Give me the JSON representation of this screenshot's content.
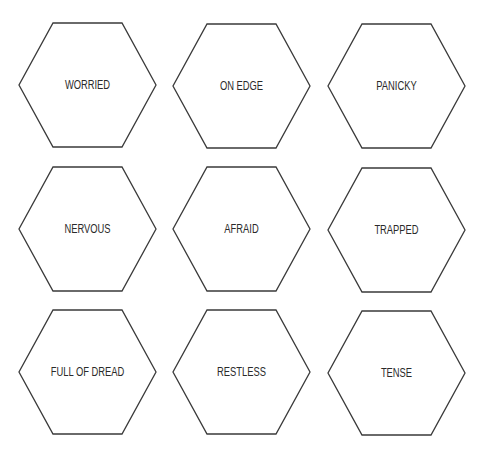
{
  "colors": {
    "stroke": "#3a3a3a",
    "text": "#2a2a2a",
    "background": "#ffffff"
  },
  "cards": [
    {
      "label": "WORRIED",
      "x": 19,
      "y": 23
    },
    {
      "label": "ON EDGE",
      "x": 173,
      "y": 24
    },
    {
      "label": "PANICKY",
      "x": 328,
      "y": 24
    },
    {
      "label": "NERVOUS",
      "x": 19,
      "y": 167
    },
    {
      "label": "AFRAID",
      "x": 173,
      "y": 167
    },
    {
      "label": "TRAPPED",
      "x": 328,
      "y": 168
    },
    {
      "label": "FULL OF DREAD",
      "x": 19,
      "y": 310
    },
    {
      "label": "RESTLESS",
      "x": 173,
      "y": 310
    },
    {
      "label": "TENSE",
      "x": 328,
      "y": 311
    }
  ]
}
